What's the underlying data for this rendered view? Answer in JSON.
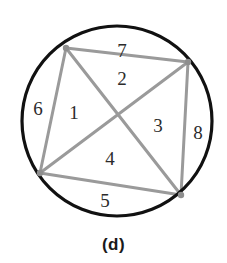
{
  "figure": {
    "caption": "(d)",
    "caption_x": 114,
    "caption_y": 245,
    "background_color": "#ffffff"
  },
  "chart_data": {
    "type": "diagram",
    "title": "(d)",
    "canvas": {
      "width": 227,
      "height": 263
    },
    "circle": {
      "cx": 117,
      "cy": 121,
      "r": 95,
      "stroke": "#111111",
      "stroke_width": 3.2,
      "fill": "none"
    },
    "vertices": [
      {
        "id": "A",
        "x": 66,
        "y": 48,
        "position": "top-left"
      },
      {
        "id": "B",
        "x": 188,
        "y": 62,
        "position": "top-right"
      },
      {
        "id": "C",
        "x": 181,
        "y": 195,
        "position": "bottom-right"
      },
      {
        "id": "D",
        "x": 40,
        "y": 173,
        "position": "bottom-left"
      }
    ],
    "chords": [
      {
        "id": "AB",
        "from": "A",
        "to": "B",
        "kind": "side"
      },
      {
        "id": "BC",
        "from": "B",
        "to": "C",
        "kind": "side"
      },
      {
        "id": "CD",
        "from": "C",
        "to": "D",
        "kind": "side"
      },
      {
        "id": "DA",
        "from": "D",
        "to": "A",
        "kind": "side"
      },
      {
        "id": "AC",
        "from": "A",
        "to": "C",
        "kind": "diagonal"
      },
      {
        "id": "BD",
        "from": "B",
        "to": "D",
        "kind": "diagonal"
      }
    ],
    "chord_stroke": "#9a9a9a",
    "chord_stroke_width": 3.0,
    "vertex_dot_color": "#8e8e8e",
    "vertex_dot_radius": 3.2,
    "diagonal_intersection": {
      "x": 117,
      "y": 117
    },
    "region_count": 8,
    "regions": [
      {
        "label": "1",
        "x": 74,
        "y": 112
      },
      {
        "label": "2",
        "x": 122,
        "y": 78
      },
      {
        "label": "3",
        "x": 158,
        "y": 125
      },
      {
        "label": "4",
        "x": 110,
        "y": 158
      },
      {
        "label": "5",
        "x": 105,
        "y": 200
      },
      {
        "label": "6",
        "x": 38,
        "y": 108
      },
      {
        "label": "7",
        "x": 122,
        "y": 50
      },
      {
        "label": "8",
        "x": 198,
        "y": 132
      }
    ]
  }
}
